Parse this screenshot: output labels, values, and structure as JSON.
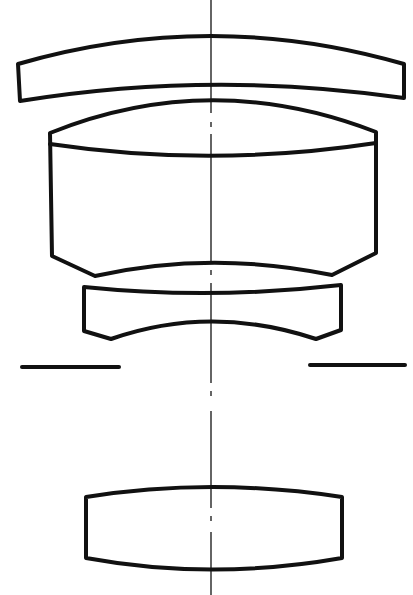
{
  "diagram": {
    "type": "optical-lens-cross-section",
    "colors": {
      "line": "#111111",
      "background": "#ffffff"
    },
    "elements": [
      {
        "id": "lens-1",
        "kind": "meniscus-lens",
        "description": "thin positive meniscus, convex toward object"
      },
      {
        "id": "lens-2",
        "kind": "cemented-doublet",
        "description": "thick cemented element with beveled rear edge"
      },
      {
        "id": "lens-3",
        "kind": "negative-lens",
        "description": "concave front and rear with beveled rear edge"
      },
      {
        "id": "aperture-stop",
        "kind": "stop",
        "description": "aperture stop marks on both sides"
      },
      {
        "id": "lens-4",
        "kind": "biconvex-lens",
        "description": "rear biconvex element"
      }
    ],
    "optical_axis": {
      "style": "dash-dot",
      "x": 211
    }
  }
}
